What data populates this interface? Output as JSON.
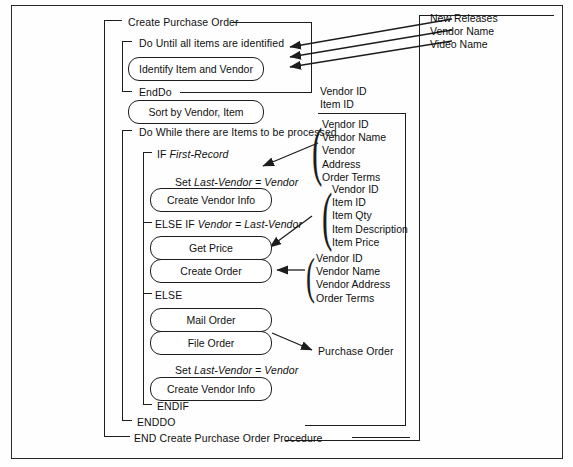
{
  "diagram": {
    "type": "structured-program-flow",
    "frame_color": "#2a2a2a",
    "line_color": "#1d1d1d",
    "text_color": "#101010"
  },
  "structure": {
    "procedure_start": "Create Purchase Order",
    "procedure_end": "END Create Purchase Order Procedure",
    "loop1_start": "Do Until all items are identified",
    "loop1_end": "EndDo",
    "loop2_start": "Do While there are Items to be processed",
    "loop2_end": "ENDDO",
    "if_keyword": "IF",
    "if_condition": "First-Record",
    "elseif_keyword": "ELSE IF",
    "elseif_condition": "Vendor = Last-Vendor",
    "else_keyword": "ELSE",
    "endif_keyword": "ENDIF",
    "set_keyword": "Set",
    "set_expression_1": "Last-Vendor = Vendor",
    "set_expression_2": "Last-Vendor = Vendor"
  },
  "process_boxes": [
    {
      "id": "identify-item-and-vendor",
      "label": "Identify Item and Vendor"
    },
    {
      "id": "sort-by-vendor-item",
      "label": "Sort by Vendor, Item"
    },
    {
      "id": "create-vendor-info-1",
      "label": "Create Vendor Info"
    },
    {
      "id": "get-price",
      "label": "Get Price"
    },
    {
      "id": "create-order",
      "label": "Create Order"
    },
    {
      "id": "mail-order",
      "label": "Mail Order"
    },
    {
      "id": "file-order",
      "label": "File Order"
    },
    {
      "id": "create-vendor-info-2",
      "label": "Create Vendor Info"
    }
  ],
  "data_annotations": {
    "top_right": {
      "id": "new-releases-group",
      "items": [
        "New Releases",
        "Vendor Name",
        "Video Name"
      ]
    },
    "vendor_item_id": {
      "id": "vendor-item-id-group",
      "items": [
        "Vendor ID",
        "Item ID"
      ]
    },
    "vendor_master": {
      "id": "vendor-master-group",
      "items": [
        "Vendor ID",
        "Vendor Name",
        "Vendor",
        "Address",
        "Order Terms"
      ]
    },
    "item_detail": {
      "id": "item-detail-group",
      "items": [
        "Vendor ID",
        "Item ID",
        "Item Qty",
        "Item Description",
        "Item Price"
      ]
    },
    "order_vendor": {
      "id": "order-vendor-group",
      "items": [
        "Vendor ID",
        "Vendor Name",
        "Vendor Address",
        "Order Terms"
      ]
    },
    "purchase_order": {
      "id": "purchase-order-output",
      "label": "Purchase Order"
    }
  }
}
